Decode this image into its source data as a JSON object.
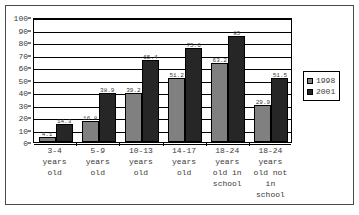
{
  "chart_data": {
    "type": "bar",
    "title": "",
    "subtitle": "",
    "xlabel": "",
    "ylabel": "",
    "ylim": [
      0,
      100
    ],
    "ytick_step": 10,
    "yticks": [
      "100",
      "90",
      "80",
      "70",
      "60",
      "50",
      "40",
      "30",
      "20",
      "10",
      "0"
    ],
    "grid": true,
    "legend_position": "right",
    "categories": [
      "3-4\nyears\nold",
      "5-9\nyears\nold",
      "10-13\nyears\nold",
      "14-17\nyears\nold",
      "18-24\nyears\nold in\nschool",
      "18-24\nyears\nold not\nin school"
    ],
    "series": [
      {
        "name": "1998",
        "color": "#808080",
        "values": [
          4.1,
          16.8,
          39.2,
          51.2,
          63.2,
          29.9
        ],
        "labels": [
          "4.1",
          "16.8",
          "39.2",
          "51.2",
          "63.2",
          "29.9"
        ]
      },
      {
        "name": "2001",
        "color": "#262626",
        "values": [
          14.3,
          38.9,
          65.4,
          75.6,
          85.0,
          51.5
        ],
        "labels": [
          "14.3",
          "38.9",
          "65.4",
          "75.6",
          "85",
          "51.5"
        ]
      }
    ]
  },
  "legend": {
    "items": [
      {
        "label": "1998",
        "color": "#808080"
      },
      {
        "label": "2001",
        "color": "#262626"
      }
    ]
  }
}
